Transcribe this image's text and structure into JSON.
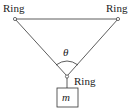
{
  "diagram": {
    "labels": {
      "top_left_ring": "Ring",
      "top_right_ring": "Ring",
      "bottom_ring": "Ring",
      "angle": "θ",
      "mass": "m"
    },
    "colors": {
      "line": "#333333",
      "background": "#ffffff"
    }
  }
}
